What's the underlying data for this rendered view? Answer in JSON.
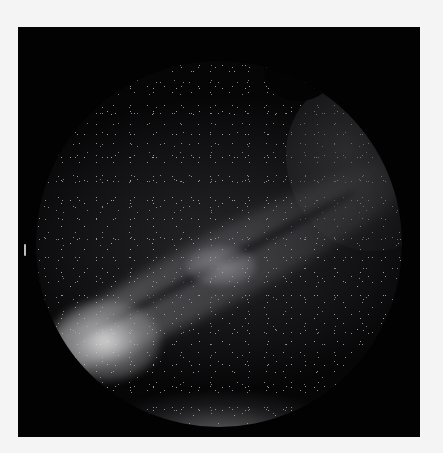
{
  "image": {
    "subject": "all-sky fisheye photograph of the Milky Way",
    "description": "Circular all-sky view with the Milky Way band crossing diagonally from lower-left (bright galactic core) to upper-right, clouds at upper right, and horizon glow at bottom",
    "colors": {
      "page_background": "#f4f4f4",
      "frame_background": "#020202",
      "core_glow": "#ebebeb",
      "sky_dark": "#121214"
    }
  }
}
